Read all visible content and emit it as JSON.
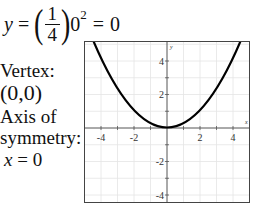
{
  "equation": {
    "lhs_var": "y",
    "equals1": "=",
    "fraction": {
      "numerator": "1",
      "denominator": "4"
    },
    "base": "0",
    "exponent": "2",
    "equals2": "=",
    "result": "0"
  },
  "annotations": {
    "vertex_label": "Vertex:",
    "vertex_value": "(0,0)",
    "axis_label_line1": "Axis of",
    "axis_label_line2": "symmetry:",
    "axis_equation_var": "x",
    "axis_equation_rest": " = 0"
  },
  "graph": {
    "function": "y = (1/4)x^2",
    "x_range": [
      -5,
      5
    ],
    "y_range": [
      -4.5,
      5.2
    ],
    "x_tick_labels": [
      "-4",
      "-2",
      "2",
      "4"
    ],
    "y_tick_labels": [
      "4",
      "2",
      "-2",
      "-4"
    ],
    "x_axis_label": "x",
    "y_axis_label": "y",
    "curve_color": "#000000",
    "grid_color": "#e4e4e4",
    "axis_color": "#555555"
  }
}
